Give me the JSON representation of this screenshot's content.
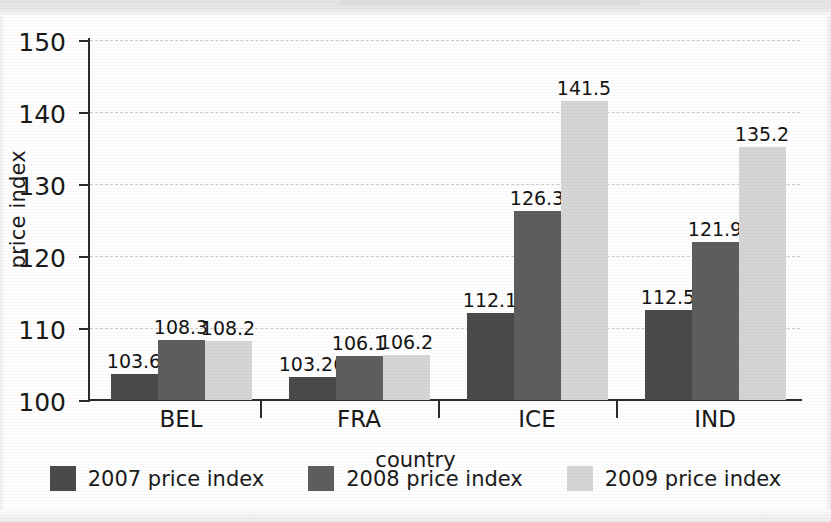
{
  "chart_data": {
    "type": "bar",
    "title": "",
    "xlabel": "country",
    "ylabel": "price index",
    "categories": [
      "BEL",
      "FRA",
      "ICE",
      "IND"
    ],
    "series": [
      {
        "name": "2007 price index",
        "color": "#4a4a4a",
        "values": [
          103.6,
          103.26,
          112.1,
          112.5
        ],
        "labels": [
          "103.6",
          "103.26",
          "112.1",
          "112.5"
        ]
      },
      {
        "name": "2008 price index",
        "color": "#5e5e5e",
        "values": [
          108.3,
          106.1,
          126.3,
          121.9
        ],
        "labels": [
          "108.3",
          "106.1",
          "126.3",
          "121.9"
        ]
      },
      {
        "name": "2009 price index",
        "color": "#d5d5d5",
        "values": [
          108.2,
          106.2,
          141.5,
          135.2
        ],
        "labels": [
          "108.2",
          "106.2",
          "141.5",
          "135.2"
        ]
      }
    ],
    "ylim": [
      100,
      150
    ],
    "yticks": [
      100,
      110,
      120,
      130,
      140,
      150
    ],
    "ytick_labels": [
      "100",
      "110",
      "120",
      "130",
      "140",
      "150"
    ],
    "grid": true,
    "legend_position": "bottom"
  },
  "axis": {
    "y_label": "price index",
    "x_label": "country",
    "tick_labels": [
      "150",
      "140",
      "130",
      "120",
      "110",
      "100"
    ]
  },
  "legend": {
    "items": [
      {
        "label": "2007 price index",
        "color": "#4a4a4a"
      },
      {
        "label": "2008 price index",
        "color": "#5e5e5e"
      },
      {
        "label": "2009 price index",
        "color": "#d5d5d5"
      }
    ]
  }
}
